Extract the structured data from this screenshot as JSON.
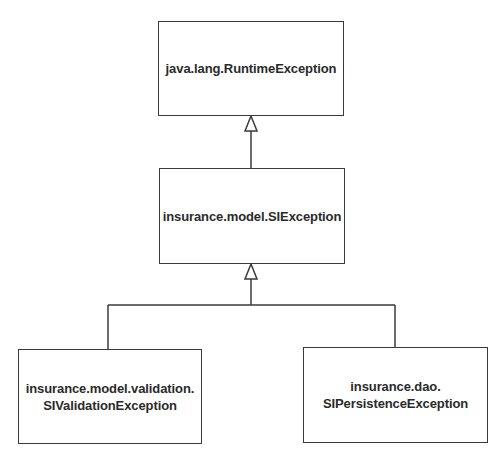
{
  "diagram": {
    "type": "UML class hierarchy",
    "colors": {
      "line": "#3a3a3a",
      "text": "#2a2a2a",
      "background": "#ffffff"
    },
    "nodes": [
      {
        "id": "runtime",
        "label": "java.lang.RuntimeException"
      },
      {
        "id": "si",
        "label": "insurance.model.SIException"
      },
      {
        "id": "validation",
        "label": "insurance.model.validation.\nSIValidationException"
      },
      {
        "id": "persistence",
        "label": "insurance.dao.\nSIPersistenceException"
      }
    ],
    "edges": [
      {
        "from": "si",
        "to": "runtime",
        "type": "generalization"
      },
      {
        "from": "validation",
        "to": "si",
        "type": "generalization"
      },
      {
        "from": "persistence",
        "to": "si",
        "type": "generalization"
      }
    ]
  }
}
